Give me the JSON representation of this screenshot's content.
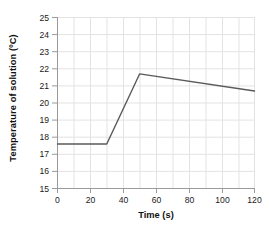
{
  "chart_data": {
    "type": "line",
    "title": "",
    "xlabel": "Time (s)",
    "ylabel": "Temperature of solution (ºC)",
    "xlim": [
      0,
      120
    ],
    "ylim": [
      15,
      25
    ],
    "xticks": [
      0,
      20,
      40,
      60,
      80,
      100,
      120
    ],
    "yticks": [
      15,
      16,
      17,
      18,
      19,
      20,
      21,
      22,
      23,
      24,
      25
    ],
    "grid": true,
    "grid_x_step": 10,
    "grid_y_step": 1,
    "legend": "none",
    "series": [
      {
        "name": "Temperature of solution",
        "color": "#5a5a5a",
        "x": [
          0,
          30,
          50,
          120
        ],
        "y": [
          17.6,
          17.6,
          21.7,
          20.7
        ]
      }
    ],
    "points": [
      {
        "x": 0,
        "y": 17.6
      },
      {
        "x": 30,
        "y": 17.6
      },
      {
        "x": 50,
        "y": 21.7
      },
      {
        "x": 120,
        "y": 20.7
      }
    ]
  },
  "axes": {
    "y_tick_labels": [
      "25",
      "24",
      "23",
      "22",
      "21",
      "20",
      "19",
      "18",
      "17",
      "16",
      "15"
    ],
    "x_tick_labels": [
      "0",
      "20",
      "40",
      "60",
      "80",
      "100",
      "120"
    ]
  },
  "colors": {
    "line": "#5a5a5a",
    "grid": "#e3e3e3",
    "axis": "#9a9a9a",
    "background": "#ffffff",
    "text": "#1a1a1a"
  }
}
